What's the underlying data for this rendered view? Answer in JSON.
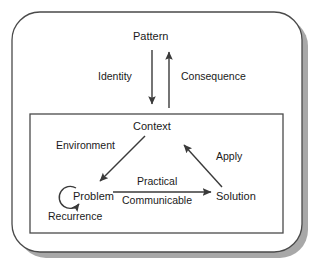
{
  "diagram": {
    "type": "concept-diagram",
    "colors": {
      "background": "#ffffff",
      "stroke": "#3a3a3a",
      "text": "#1a1a1a",
      "shadow": "#a8a8a8",
      "inner_box_stroke": "#4a4a4a"
    },
    "outer_container": {
      "name": "outer-rounded-box",
      "shape": "rounded-rectangle",
      "has_shadow": true
    },
    "inner_container": {
      "name": "inner-box",
      "shape": "rectangle",
      "has_shadow": false
    },
    "nodes": [
      {
        "id": "pattern",
        "label": "Pattern",
        "x": 151,
        "y": 36,
        "region": "outer"
      },
      {
        "id": "context",
        "label": "Context",
        "x": 151,
        "y": 126,
        "region": "inner"
      },
      {
        "id": "problem",
        "label": "Problem",
        "x": 91,
        "y": 196,
        "region": "inner"
      },
      {
        "id": "solution",
        "label": "Solution",
        "x": 238,
        "y": 196,
        "region": "inner"
      }
    ],
    "edges": [
      {
        "id": "identity",
        "label": "Identity",
        "from": "pattern",
        "to": "context",
        "direction": "down",
        "label_x": 100,
        "label_y": 76
      },
      {
        "id": "consequence",
        "label": "Consequence",
        "from": "context",
        "to": "pattern",
        "direction": "up",
        "label_x": 180,
        "label_y": 76
      },
      {
        "id": "environment",
        "label": "Environment",
        "from": "context",
        "to": "problem",
        "direction": "down-left",
        "label_x": 58,
        "label_y": 145
      },
      {
        "id": "apply",
        "label": "Apply",
        "from": "solution",
        "to": "context",
        "direction": "up-left",
        "label_x": 216,
        "label_y": 156
      },
      {
        "id": "practical",
        "label": "Practical",
        "from": "problem",
        "to": "solution",
        "direction": "right",
        "label_x": 142,
        "label_y": 180
      },
      {
        "id": "communicable",
        "label": "Communicable",
        "from": "problem",
        "to": "solution",
        "direction": "right",
        "label_x": 127,
        "label_y": 197
      },
      {
        "id": "recurrence",
        "label": "Recurrence",
        "from": "problem",
        "to": "problem",
        "direction": "self-loop",
        "label_x": 50,
        "label_y": 216
      }
    ]
  }
}
